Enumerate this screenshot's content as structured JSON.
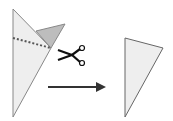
{
  "diagram": {
    "steps": [
      {
        "name": "folded-paper-with-cut-line",
        "cut_line": "dotted"
      },
      {
        "name": "scissors-cut"
      },
      {
        "name": "arrow"
      },
      {
        "name": "result-triangle"
      }
    ],
    "colors": {
      "paper": "#eeeeee",
      "flap": "#bdbdbd",
      "stroke": "#777777",
      "dots": "#555555",
      "arrow": "#333333"
    }
  }
}
